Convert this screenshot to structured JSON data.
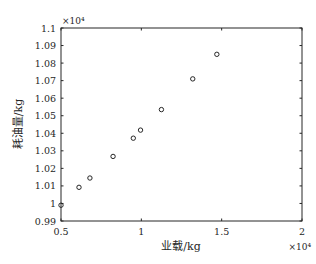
{
  "chart_data": {
    "type": "scatter",
    "title": "",
    "xlabel": "业载/kg",
    "ylabel": "耗油量/kg",
    "x_multiplier": "×10⁴",
    "y_multiplier": "×10⁴",
    "xlim": [
      0.5,
      2
    ],
    "ylim": [
      0.99,
      1.1
    ],
    "xticks": [
      0.5,
      1,
      1.5,
      2
    ],
    "xtick_labels": [
      "0.5",
      "1",
      "1.5",
      "2"
    ],
    "yticks": [
      0.99,
      1,
      1.01,
      1.02,
      1.03,
      1.04,
      1.05,
      1.06,
      1.07,
      1.08,
      1.09,
      1.1
    ],
    "ytick_labels": [
      "0.99",
      "1",
      "1.01",
      "1.02",
      "1.03",
      "1.04",
      "1.05",
      "1.06",
      "1.07",
      "1.08",
      "1.09",
      "1.1"
    ],
    "grid": false,
    "legend": null,
    "marker": "open-circle",
    "series": [
      {
        "name": "耗油量",
        "x": [
          0.5,
          0.612,
          0.68,
          0.824,
          0.95,
          0.995,
          1.125,
          1.32,
          1.47
        ],
        "y": [
          0.999,
          1.0092,
          1.0145,
          1.0268,
          1.0372,
          1.0418,
          1.0535,
          1.071,
          1.085
        ]
      }
    ]
  },
  "colors": {
    "axis": "#262626",
    "marker": "#262626",
    "background": "#ffffff"
  }
}
